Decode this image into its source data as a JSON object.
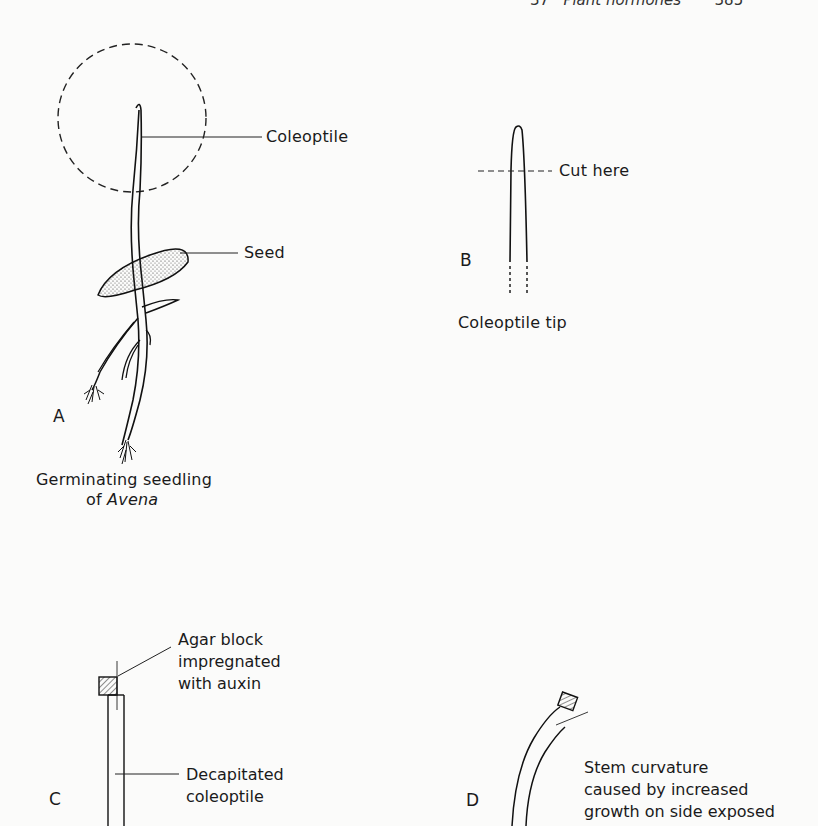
{
  "header": {
    "chapter": "37",
    "title": "Plant hormones",
    "page_number": "385"
  },
  "figure": {
    "panel_a": {
      "letter": "A",
      "labels": {
        "coleoptile": "Coleoptile",
        "seed": "Seed"
      },
      "caption_line1": "Germinating seedling",
      "caption_line2_prefix": "of ",
      "caption_line2_italic": "Avena"
    },
    "panel_b": {
      "letter": "B",
      "labels": {
        "cut": "Cut here"
      },
      "caption": "Coleoptile tip"
    },
    "panel_c": {
      "letter": "C",
      "agar_label": [
        "Agar block",
        "impregnated",
        "with auxin"
      ],
      "stem_label": [
        "Decapitated",
        "coleoptile"
      ]
    },
    "panel_d": {
      "letter": "D",
      "label": [
        "Stem curvature",
        "caused by increased",
        "growth on side exposed"
      ]
    }
  }
}
